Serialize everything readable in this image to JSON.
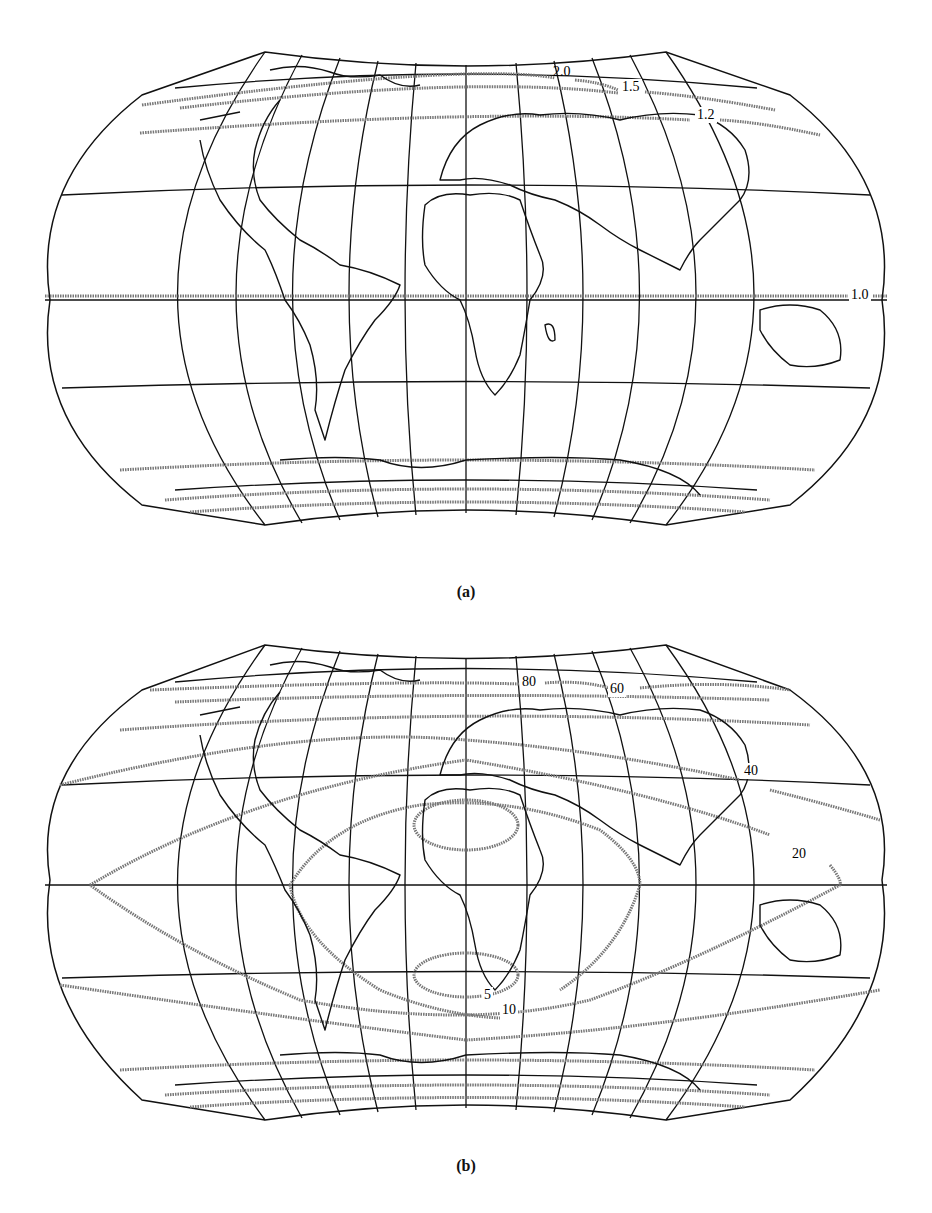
{
  "figures": [
    {
      "id": "a",
      "caption": "(a)",
      "projection": "pseudocylindrical world map with graticule",
      "isoline_labels": [
        {
          "text": "2.0",
          "x": 560,
          "y": 80
        },
        {
          "text": "1.5",
          "x": 625,
          "y": 94
        },
        {
          "text": "1.2",
          "x": 700,
          "y": 122
        },
        {
          "text": "1.0",
          "x": 856,
          "y": 298
        }
      ]
    },
    {
      "id": "b",
      "caption": "(b)",
      "projection": "pseudocylindrical world map with graticule",
      "isoline_labels": [
        {
          "text": "80",
          "x": 533,
          "y": 691
        },
        {
          "text": "60",
          "x": 620,
          "y": 700
        },
        {
          "text": "40",
          "x": 752,
          "y": 781
        },
        {
          "text": "20",
          "x": 800,
          "y": 857
        },
        {
          "text": "5",
          "x": 488,
          "y": 999
        },
        {
          "text": "10",
          "x": 510,
          "y": 1014
        }
      ]
    }
  ],
  "colors": {
    "line": "#111111",
    "isoline": "#777777",
    "background": "#ffffff"
  }
}
